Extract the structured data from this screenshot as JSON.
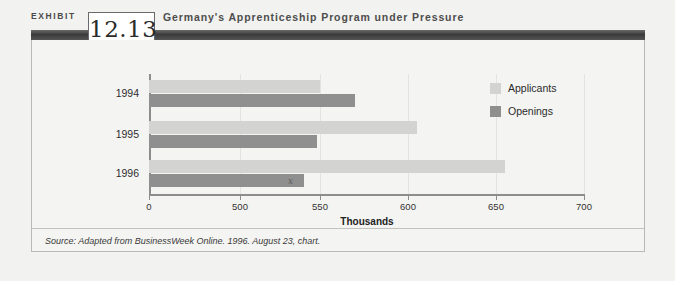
{
  "exhibit": {
    "label": "EXHIBIT",
    "number": "12.13",
    "title": "Germany's Apprenticeship Program under Pressure"
  },
  "source": {
    "text": "Source: Adapted from BusinessWeek Online. 1996. August 23, chart."
  },
  "legend": {
    "items": [
      {
        "label": "Applicants",
        "color": "#d3d3d1"
      },
      {
        "label": "Openings",
        "color": "#8f8f8f"
      }
    ]
  },
  "marker": {
    "glyph": "x"
  },
  "chart_data": {
    "type": "bar",
    "orientation": "horizontal",
    "title": "Germany's Apprenticeship Program under Pressure",
    "xlabel": "Thousands",
    "ylabel": "",
    "categories": [
      "1994",
      "1995",
      "1996"
    ],
    "series": [
      {
        "name": "Applicants",
        "color": "#d3d3d1",
        "values": [
          550,
          605,
          655
        ]
      },
      {
        "name": "Openings",
        "color": "#8f8f8f",
        "values": [
          570,
          548,
          540
        ]
      }
    ],
    "tick_labels": [
      "0",
      "500",
      "550",
      "600",
      "650",
      "700"
    ],
    "tick_values": [
      0,
      500,
      550,
      600,
      650,
      700
    ],
    "axis_break": true,
    "xlim": [
      0,
      700
    ],
    "grid": true,
    "legend_position": "top-right"
  }
}
